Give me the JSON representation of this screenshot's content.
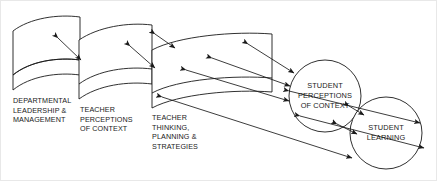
{
  "diagram": {
    "type": "flow-diagram",
    "stroke_color": "#1a1a1a",
    "background_color": "#ffffff",
    "border_color": "#e8e8e8"
  },
  "panels": [
    {
      "id": "panel-departmental-leadership",
      "label": "DEPARTMENTAL\nLEADERSHIP &\nMANAGEMENT",
      "label_x": 13,
      "label_y": 96,
      "shape": "curved-card",
      "left_x": 13,
      "right_x": 80,
      "top_y": 17,
      "bottom_y": 90
    },
    {
      "id": "panel-teacher-perceptions",
      "label": "TEACHER\nPERCEPTIONS\nOF CONTEXT",
      "label_x": 80,
      "label_y": 105,
      "shape": "curved-card",
      "left_x": 79,
      "right_x": 152,
      "top_y": 25,
      "bottom_y": 99
    },
    {
      "id": "panel-teacher-thinking",
      "label": "TEACHER\nTHINKING,\nPLANNING &\nSTRATEGIES",
      "label_x": 152,
      "label_y": 113,
      "shape": "curved-card",
      "left_x": 152,
      "right_x": 272,
      "top_y": 34,
      "bottom_y": 108
    }
  ],
  "circles": [
    {
      "id": "circle-student-perceptions",
      "lines": [
        "STUDENT",
        "PERCEPTIONS",
        "OF CONTEXT"
      ],
      "cx": 325,
      "cy": 96,
      "r": 36
    },
    {
      "id": "circle-student-learning",
      "lines": [
        "STUDENT",
        "LEARNING"
      ],
      "cx": 386,
      "cy": 133,
      "r": 36
    }
  ],
  "connectors": [
    {
      "id": "arrow-panel1-to-panel2",
      "heads": "double"
    },
    {
      "id": "arrow-panel2-to-panel3-upper",
      "heads": "double"
    },
    {
      "id": "arrow-panel2-to-panel3-lower",
      "heads": "double"
    },
    {
      "id": "arrow-panel3-to-perceptions-upper",
      "heads": "double"
    },
    {
      "id": "arrow-panel3-to-perceptions-middle",
      "heads": "double"
    },
    {
      "id": "arrow-panel3-to-perceptions-lower",
      "heads": "double"
    },
    {
      "id": "arrow-perceptions-to-learning-upper",
      "heads": "double"
    },
    {
      "id": "arrow-perceptions-to-learning-lower",
      "heads": "double"
    },
    {
      "id": "arrow-panel3-to-learning-long",
      "heads": "double"
    }
  ]
}
